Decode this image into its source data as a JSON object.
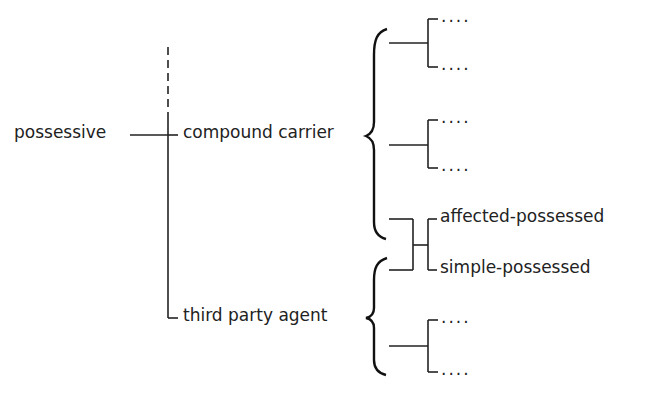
{
  "diagram": {
    "type": "systemic-network",
    "root": {
      "label": "possessive"
    },
    "features": [
      {
        "id": "compound-carrier",
        "label": "compound carrier"
      },
      {
        "id": "third-party-agent",
        "label": "third party agent"
      }
    ],
    "compound_carrier_subsystems": [
      {
        "options": [
          "....",
          "...."
        ]
      },
      {
        "options": [
          "....",
          "...."
        ]
      }
    ],
    "shared_system": {
      "options": [
        "affected-possessed",
        "simple-possessed"
      ]
    },
    "third_party_agent_subsystems": [
      {
        "options": [
          "....",
          "...."
        ]
      }
    ],
    "colors": {
      "ink": "#222222",
      "background": "#ffffff"
    }
  }
}
